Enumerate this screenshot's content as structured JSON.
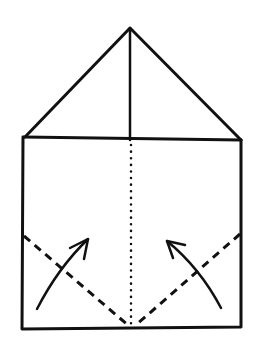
{
  "diagram": {
    "type": "origami-fold-step",
    "stroke_color": "#111111",
    "background": "#ffffff",
    "roof": {
      "apex": [
        130,
        28
      ],
      "base_left": [
        25,
        137
      ],
      "base_right": [
        241,
        140
      ]
    },
    "body": {
      "left": 23,
      "right": 241,
      "top": 138,
      "bottom": 329
    },
    "center_line_solid": {
      "from": [
        130,
        28
      ],
      "to": [
        130,
        140
      ]
    },
    "center_line_dotted": {
      "from": [
        131,
        145
      ],
      "to": [
        131,
        325
      ]
    },
    "fold_lines_dashed": [
      {
        "from": [
          24,
          236
        ],
        "to": [
          129,
          326
        ]
      },
      {
        "from": [
          240,
          234
        ],
        "to": [
          136,
          325
        ]
      }
    ],
    "arrows": [
      {
        "direction": "up-right",
        "tail": [
          37,
          309
        ],
        "tip": [
          88,
          239
        ]
      },
      {
        "direction": "up-left",
        "tail": [
          221,
          308
        ],
        "tip": [
          167,
          241
        ]
      }
    ]
  }
}
